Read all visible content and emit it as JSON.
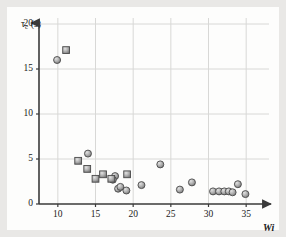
{
  "figure": {
    "background_color": "#e9e8e6",
    "canvas_color": "#fdfdfc",
    "grid_color": "#d8d8d6",
    "axis_color": "#3a3a3a",
    "marker_fill": "#a8a8a8",
    "marker_edge": "#4a4a4a"
  },
  "chart_data": {
    "type": "scatter",
    "title": "",
    "xlabel": "Wi",
    "ylabel": "τc (s)",
    "ylabel_symbol": "τ",
    "ylabel_subscript": "c",
    "ylabel_unit": "(s)",
    "xlim": [
      7.5,
      37.5
    ],
    "ylim": [
      0,
      20
    ],
    "xticks": [
      10,
      15,
      20,
      25,
      30,
      35
    ],
    "xtick_labels": [
      "10",
      "15",
      "20",
      "25",
      "30",
      "35"
    ],
    "yticks": [
      0,
      5,
      10,
      15,
      20
    ],
    "ytick_labels": [
      "0",
      "5",
      "10",
      "15",
      "20"
    ],
    "grid": true,
    "legend": null,
    "legend_position": "none",
    "series": [
      {
        "name": "circle-markers",
        "marker": "circle",
        "points": [
          [
            9.9,
            16.0
          ],
          [
            14.0,
            5.6
          ],
          [
            17.6,
            3.1
          ],
          [
            17.3,
            2.7
          ],
          [
            18.0,
            1.7
          ],
          [
            18.3,
            1.9
          ],
          [
            19.1,
            1.5
          ],
          [
            21.1,
            2.1
          ],
          [
            23.6,
            4.4
          ],
          [
            26.2,
            1.6
          ],
          [
            27.8,
            2.4
          ],
          [
            30.6,
            1.4
          ],
          [
            31.4,
            1.4
          ],
          [
            32.1,
            1.4
          ],
          [
            32.7,
            1.4
          ],
          [
            33.2,
            1.3
          ],
          [
            33.9,
            2.2
          ],
          [
            34.9,
            1.1
          ]
        ]
      },
      {
        "name": "square-markers",
        "marker": "square",
        "points": [
          [
            11.1,
            17.1
          ],
          [
            12.7,
            4.8
          ],
          [
            13.9,
            3.9
          ],
          [
            15.0,
            2.8
          ],
          [
            16.0,
            3.3
          ],
          [
            17.1,
            2.8
          ],
          [
            19.2,
            3.3
          ]
        ]
      }
    ]
  }
}
